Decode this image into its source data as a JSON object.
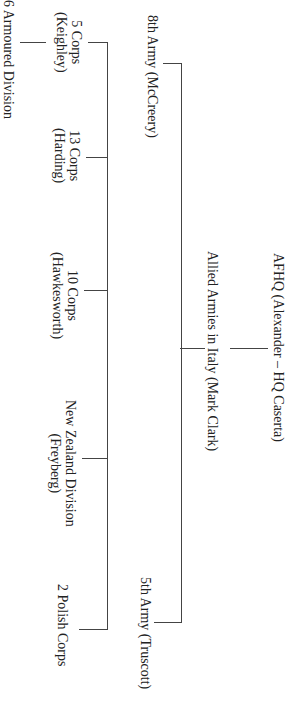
{
  "diagram": {
    "type": "org-chart",
    "orientation": "rotated-90-clockwise",
    "root": {
      "label": "AFHQ (Alexander – HQ Caserta)",
      "children": [
        {
          "label": "Allied Armies in Italy (Mark Clark)",
          "children": [
            {
              "label": "8th Army (McCreery)",
              "children": [
                {
                  "line1": "5 Corps",
                  "line2": "(Keighley)",
                  "children": [
                    {
                      "label": "6 Armoured Division"
                    }
                  ]
                },
                {
                  "line1": "13 Corps",
                  "line2": "(Harding)"
                },
                {
                  "line1": "10 Corps",
                  "line2": "(Hawkesworth)"
                },
                {
                  "line1": "New Zealand Division",
                  "line2": "(Freyberg)"
                },
                {
                  "line1": "2 Polish Corps",
                  "line2": ""
                }
              ]
            },
            {
              "label": "5th Army (Truscott)"
            }
          ]
        }
      ]
    },
    "colors": {
      "line": "#444444",
      "text": "#222222",
      "background": "#ffffff"
    }
  }
}
